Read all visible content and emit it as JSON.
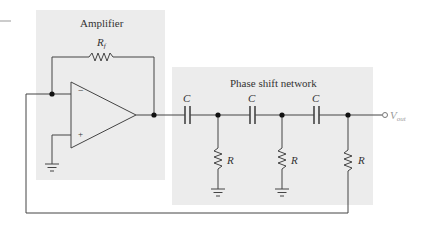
{
  "diagram": {
    "type": "circuit",
    "colors": {
      "box_fill": "#ececec",
      "wire": "#444444",
      "text": "#333333",
      "output_label": "#9a9a9a"
    },
    "blocks": {
      "amplifier": {
        "label": "Amplifier"
      },
      "network": {
        "label": "Phase shift network"
      }
    },
    "components": {
      "feedback_resistor": {
        "symbol": "R",
        "subscript": "f"
      },
      "capacitors": [
        {
          "label": "C"
        },
        {
          "label": "C"
        },
        {
          "label": "C"
        }
      ],
      "resistors": [
        {
          "label": "R"
        },
        {
          "label": "R"
        },
        {
          "label": "R"
        }
      ],
      "opamp": {
        "inverting": "−",
        "noninverting": "+"
      },
      "output": {
        "symbol": "V",
        "subscript": "out"
      }
    }
  }
}
